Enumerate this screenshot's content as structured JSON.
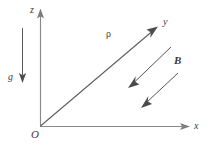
{
  "figure": {
    "background_color": "#ffffff",
    "axis_color": "#8a8a8a",
    "vector_color": "#4d4d4d",
    "field_color": "#4a4a4a",
    "label_color": "#3b3b3b",
    "origin": {
      "x": 40,
      "y": 126
    },
    "labels": {
      "z_axis": "z",
      "y_axis": "y",
      "x_axis": "x",
      "origin": "O",
      "gravity": "g",
      "density": "ρ",
      "magnetic_field": "B"
    },
    "axes": [
      {
        "name": "z-axis",
        "from": [
          40,
          126
        ],
        "to": [
          40,
          11
        ],
        "label": "z",
        "direction": "up"
      },
      {
        "name": "x-axis",
        "from": [
          40,
          126
        ],
        "to": [
          189,
          126
        ],
        "label": "x",
        "direction": "right"
      },
      {
        "name": "y-axis",
        "from": [
          40,
          126
        ],
        "to": [
          157,
          27
        ],
        "label": "y",
        "direction": "up-right"
      }
    ],
    "vectors": [
      {
        "name": "gravity-vector",
        "label": "g",
        "from": [
          22,
          28
        ],
        "to": [
          22,
          82
        ],
        "direction": "down"
      },
      {
        "name": "magnetic-field-vector-1",
        "label": "B",
        "from": [
          171,
          47
        ],
        "to": [
          129,
          87
        ],
        "direction": "down-left"
      },
      {
        "name": "magnetic-field-vector-2",
        "label": "B",
        "from": [
          178,
          73
        ],
        "to": [
          141,
          107
        ],
        "direction": "down-left"
      }
    ],
    "annotations": [
      {
        "name": "rho-label",
        "text": "ρ",
        "at": [
          110,
          35
        ]
      }
    ]
  }
}
